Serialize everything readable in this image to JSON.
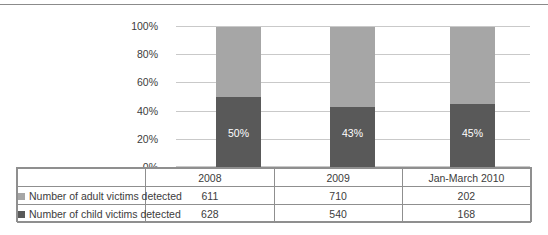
{
  "chart_data": {
    "type": "bar",
    "subtype": "stacked-percentage",
    "title": "",
    "xlabel": "",
    "ylabel": "",
    "ylim": [
      0,
      100
    ],
    "grid": true,
    "legend_position": "bottom-table",
    "categories": [
      "2008",
      "2009",
      "Jan-March 2010"
    ],
    "series": [
      {
        "name": "Number of adult victims detected",
        "color": "#a6a6a6",
        "values": [
          611,
          710,
          202
        ],
        "percent": [
          50,
          57,
          55
        ]
      },
      {
        "name": "Number of child victims detected",
        "color": "#595959",
        "values": [
          628,
          540,
          168
        ],
        "percent": [
          50,
          43,
          45
        ]
      }
    ],
    "bar_labels": [
      "50%",
      "43%",
      "45%"
    ],
    "y_ticks": [
      "0%",
      "20%",
      "40%",
      "60%",
      "80%",
      "100%"
    ],
    "y_tick_values": [
      0,
      20,
      40,
      60,
      80,
      100
    ]
  },
  "axis": {
    "y_ticks": [
      "100%",
      "80%",
      "60%",
      "40%",
      "20%",
      "0%"
    ]
  },
  "bars": [
    {
      "category": "2008",
      "child_pct": 50,
      "adult_pct": 50,
      "label": "50%"
    },
    {
      "category": "2009",
      "child_pct": 43,
      "adult_pct": 57,
      "label": "43%"
    },
    {
      "category": "Jan-March 2010",
      "child_pct": 45,
      "adult_pct": 55,
      "label": "45%"
    }
  ],
  "table": {
    "header_row": [
      "",
      "2008",
      "2009",
      "Jan-March 2010"
    ],
    "rows": [
      {
        "legend": "Number of adult victims detected",
        "swatch": "adult-swatch",
        "values": [
          "611",
          "710",
          "202"
        ]
      },
      {
        "legend": "Number of child victims detected",
        "swatch": "child-swatch",
        "values": [
          "628",
          "540",
          "168"
        ]
      }
    ]
  },
  "colors": {
    "adult": "#a6a6a6",
    "child": "#595959",
    "gridline": "#c9c9c9",
    "border": "#8f8f8f",
    "text": "#3c3c3c"
  }
}
